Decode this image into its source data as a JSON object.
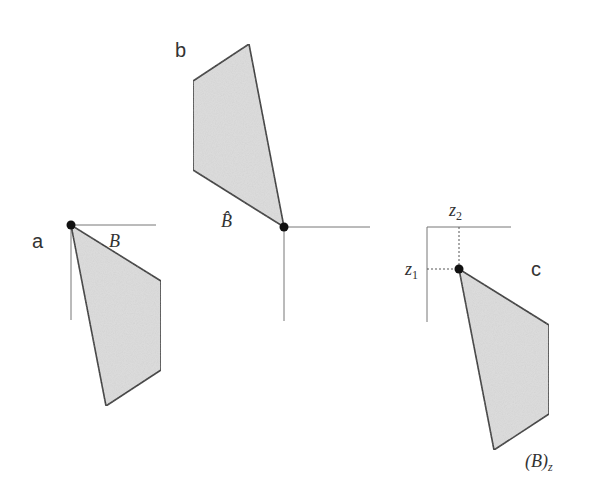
{
  "panels": {
    "a": {
      "label": "a",
      "set_label": "B",
      "origin": [
        71,
        225
      ],
      "axis_h_end": 156,
      "axis_v_end": 320,
      "polygon": [
        [
          71,
          225
        ],
        [
          161,
          281
        ],
        [
          161,
          370
        ],
        [
          106,
          406
        ]
      ]
    },
    "b": {
      "label": "b",
      "set_label": "B̂",
      "origin": [
        284,
        227
      ],
      "axis_h_end": 370,
      "axis_v_end": 321,
      "polygon": [
        [
          249,
          44
        ],
        [
          193,
          81
        ],
        [
          193,
          170
        ],
        [
          284,
          227
        ]
      ]
    },
    "c": {
      "label": "c",
      "set_label": "(B)",
      "set_label_sub": "z",
      "z1_label": "z",
      "z1_sub": "1",
      "z2_label": "z",
      "z2_sub": "2",
      "corner": [
        427,
        227
      ],
      "point": [
        459,
        269
      ],
      "axis_h_end": 511,
      "axis_v_end": 322,
      "polygon": [
        [
          459,
          269
        ],
        [
          549,
          325
        ],
        [
          549,
          414
        ],
        [
          494,
          450
        ]
      ]
    }
  },
  "colors": {
    "fill": "#dcdcdc",
    "stroke": "#333333",
    "axis": "#777777",
    "dot": "#111111",
    "text": "#333333"
  }
}
